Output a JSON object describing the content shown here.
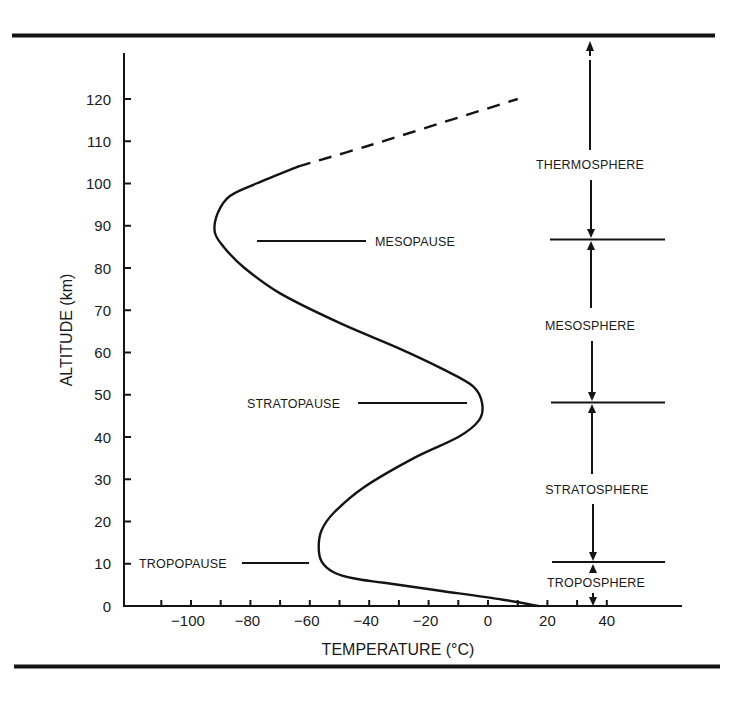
{
  "chart_data": {
    "type": "line",
    "title": "",
    "xlabel": "TEMPERATURE (°C)",
    "ylabel": "ALTITUDE (km)",
    "xlim": [
      -122,
      60
    ],
    "ylim": [
      0,
      130
    ],
    "grid": false,
    "legend": null,
    "x_ticks": [
      -110,
      -100,
      -90,
      -80,
      -70,
      -60,
      -50,
      -40,
      -30,
      -20,
      -10,
      0,
      10,
      20,
      30,
      40
    ],
    "x_tick_labels": [
      {
        "value": -100,
        "label": "−100"
      },
      {
        "value": -80,
        "label": "−80"
      },
      {
        "value": -60,
        "label": "−60"
      },
      {
        "value": -40,
        "label": "−40"
      },
      {
        "value": -20,
        "label": "−20"
      },
      {
        "value": 0,
        "label": "0"
      },
      {
        "value": 20,
        "label": "20"
      },
      {
        "value": 40,
        "label": "40"
      }
    ],
    "y_ticks": [
      0,
      10,
      20,
      30,
      40,
      50,
      60,
      70,
      80,
      90,
      100,
      110,
      120
    ],
    "y_tick_labels": [
      "0",
      "10",
      "20",
      "30",
      "40",
      "50",
      "60",
      "70",
      "80",
      "90",
      "100",
      "110",
      "120"
    ],
    "series": [
      {
        "name": "Temperature profile (solid)",
        "style": "solid",
        "x": [
          17,
          5,
          -15,
          -35,
          -45,
          -52,
          -56,
          -57,
          -56,
          -52,
          -42,
          -25,
          -10,
          -3,
          -2,
          -5,
          -15,
          -30,
          -50,
          -70,
          -82,
          -89,
          -92,
          -91,
          -87,
          -78,
          -64
        ],
        "y": [
          0,
          1.5,
          3.5,
          5.5,
          6.5,
          8,
          10.5,
          14,
          18,
          22,
          28,
          35,
          40,
          44,
          48,
          52,
          56,
          61,
          67,
          74,
          80,
          85,
          88.5,
          93,
          97,
          100,
          104
        ]
      },
      {
        "name": "Temperature profile (dashed extrapolation)",
        "style": "dashed",
        "x": [
          -64,
          -40,
          -15,
          10
        ],
        "y": [
          104,
          109,
          114.5,
          120
        ]
      }
    ],
    "annotations": [
      {
        "label": "TROPOPAUSE",
        "altitude": 11,
        "line_x": [
          -83,
          -60
        ]
      },
      {
        "label": "STRATOPAUSE",
        "altitude": 48,
        "line_x": [
          -45,
          -7
        ]
      },
      {
        "label": "MESOPAUSE",
        "altitude": 87,
        "line_x": [
          -79,
          -42
        ]
      }
    ],
    "layers": [
      {
        "name": "TROPOSPHERE",
        "bottom": 0,
        "top": 11
      },
      {
        "name": "STRATOSPHERE",
        "bottom": 11,
        "top": 48
      },
      {
        "name": "MESOSPHERE",
        "bottom": 48,
        "top": 87
      },
      {
        "name": "THERMOSPHERE",
        "bottom": 87,
        "top": 130
      }
    ]
  },
  "labels": {
    "x_axis_title": "TEMPERATURE (°C)",
    "y_axis_title": "ALTITUDE (km)",
    "tropopause": "TROPOPAUSE",
    "stratopause": "STRATOPAUSE",
    "mesopause": "MESOPAUSE",
    "troposphere": "TROPOSPHERE",
    "stratosphere": "STRATOSPHERE",
    "mesosphere": "MESOSPHERE",
    "thermosphere": "THERMOSPHERE"
  },
  "colors": {
    "ink": "#141414",
    "background": "#ffffff"
  }
}
